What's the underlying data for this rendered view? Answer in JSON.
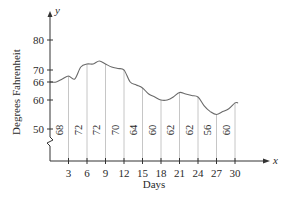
{
  "chart_data": {
    "type": "line",
    "title": "",
    "xlabel": "Days",
    "ylabel": "Degrees Fahrenheit",
    "x_axis_letter": "x",
    "y_axis_letter": "y",
    "x_ticks": [
      3,
      6,
      9,
      12,
      15,
      18,
      21,
      24,
      27,
      30
    ],
    "y_ticks": [
      50,
      60,
      66,
      70,
      80
    ],
    "xlim": [
      0,
      32
    ],
    "ylim_display": [
      50,
      85
    ],
    "y_axis_break": true,
    "grid": false,
    "legend": null,
    "vertical_line_labels": [
      {
        "x": 3,
        "label": "68"
      },
      {
        "x": 6,
        "label": "72"
      },
      {
        "x": 9,
        "label": "72"
      },
      {
        "x": 12,
        "label": "70"
      },
      {
        "x": 15,
        "label": "64"
      },
      {
        "x": 18,
        "label": "60"
      },
      {
        "x": 21,
        "label": "62"
      },
      {
        "x": 24,
        "label": "62"
      },
      {
        "x": 27,
        "label": "56"
      },
      {
        "x": 30,
        "label": "60"
      }
    ],
    "series": [
      {
        "name": "Temperature",
        "x": [
          0,
          1,
          2,
          3,
          4,
          5,
          6,
          7,
          8,
          9,
          10,
          11,
          12,
          13,
          14,
          15,
          16,
          17,
          18,
          19,
          20,
          21,
          22,
          23,
          24,
          25,
          26,
          27,
          28,
          29,
          30,
          30.5
        ],
        "values": [
          66,
          66,
          67,
          68,
          67,
          71,
          72,
          72,
          73,
          72,
          71,
          70.5,
          70,
          66,
          65,
          64,
          62,
          61,
          60,
          60,
          61,
          62.5,
          62,
          61.5,
          61,
          58,
          56,
          55,
          56,
          57,
          59,
          59
        ]
      }
    ]
  }
}
